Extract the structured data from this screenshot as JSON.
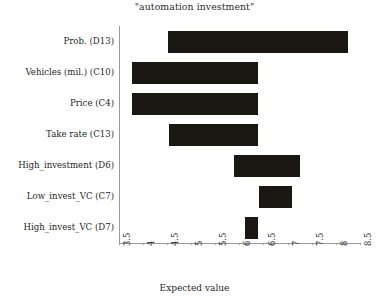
{
  "chart_data": {
    "type": "bar",
    "orientation": "horizontal",
    "subtype": "tornado",
    "title": "\"automation investment\"",
    "xlabel": "Expected value",
    "ylabel": "",
    "xlim": [
      3.5,
      8.5
    ],
    "xticks": [
      "3.5",
      "4",
      "4.5",
      "5",
      "5.5",
      "6",
      "6.5",
      "7",
      "7.5",
      "8",
      "8.5"
    ],
    "xtick_values": [
      3.5,
      4,
      4.5,
      5,
      5.5,
      6,
      6.5,
      7,
      7.5,
      8,
      8.5
    ],
    "grid": false,
    "legend": false,
    "bar_color": "#1b1814",
    "categories": [
      "Prob. (D13)",
      "Vehicles (mil.) (C10)",
      "Price (C4)",
      "Take rate (C13)",
      "High_investment (D6)",
      "Low_invest_VC (C7)",
      "High_invest_VC (D7)"
    ],
    "bars": [
      {
        "label": "Prob. (D13)",
        "low": 4.53,
        "high": 8.25,
        "span": 3.72
      },
      {
        "label": "Vehicles (mil.) (C10)",
        "low": 3.77,
        "high": 6.39,
        "span": 2.62
      },
      {
        "label": "Price (C4)",
        "low": 3.77,
        "high": 6.39,
        "span": 2.62
      },
      {
        "label": "Take rate (C13)",
        "low": 4.55,
        "high": 6.39,
        "span": 1.84
      },
      {
        "label": "High_investment (D6)",
        "low": 5.9,
        "high": 7.26,
        "span": 1.36
      },
      {
        "label": "Low_invest_VC (C7)",
        "low": 6.41,
        "high": 7.09,
        "span": 0.68
      },
      {
        "label": "High_invest_VC (D7)",
        "low": 6.12,
        "high": 6.39,
        "span": 0.27
      }
    ]
  }
}
